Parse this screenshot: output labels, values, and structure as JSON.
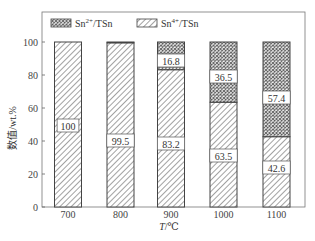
{
  "chart_data": {
    "type": "bar",
    "stacked": true,
    "title": "",
    "xlabel": "T/℃",
    "ylabel": "数值/wt.%",
    "ylim": [
      0,
      100
    ],
    "yticks": [
      0,
      20,
      40,
      60,
      80,
      100
    ],
    "categories": [
      "700",
      "800",
      "900",
      "1000",
      "1100"
    ],
    "series": [
      {
        "name": "Sn4+/TSn",
        "pattern": "diagonal-hatch",
        "values": [
          100,
          99.5,
          83.2,
          63.5,
          42.6
        ],
        "labels": [
          "100",
          "99.5",
          "83.2",
          "63.5",
          "42.6"
        ]
      },
      {
        "name": "Sn2+/TSn",
        "pattern": "cross-hatch",
        "values": [
          0,
          0.5,
          16.8,
          36.5,
          57.4
        ],
        "labels": [
          "",
          "",
          "16.8",
          "36.5",
          "57.4"
        ]
      }
    ],
    "legend": {
      "position": "top-left-inside",
      "entries": [
        {
          "label_base": "Sn",
          "label_sup": "2+",
          "label_rest": "/TSn",
          "pattern": "cross-hatch"
        },
        {
          "label_base": "Sn",
          "label_sup": "4+",
          "label_rest": "/TSn",
          "pattern": "diagonal-hatch"
        }
      ]
    },
    "grid": false,
    "colors": {
      "stroke": "#444444",
      "background": "#ffffff"
    }
  }
}
